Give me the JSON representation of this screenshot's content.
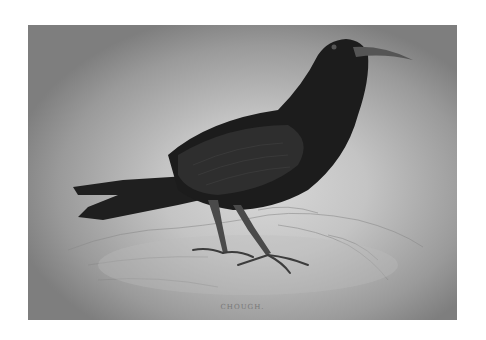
{
  "image": {
    "subject": "chough bird illustration",
    "caption": "CHOUGH.",
    "colors": {
      "background": "#ffffff",
      "plate_center": "#d8d8d8",
      "plate_edge": "#7e7e7e",
      "bird_body": "#1e1e1e",
      "bird_legs": "#4a4a4a"
    }
  }
}
